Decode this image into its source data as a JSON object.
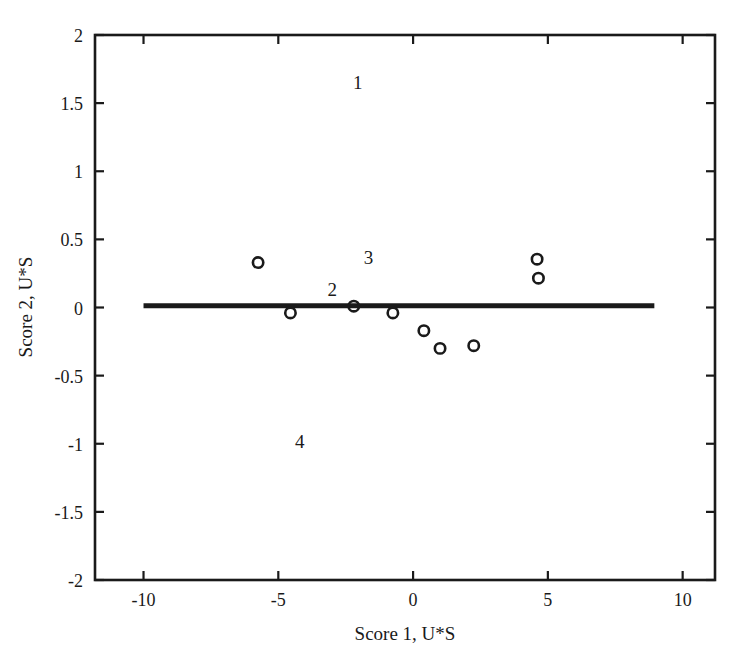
{
  "chart_data": {
    "type": "scatter",
    "title": "",
    "xlabel": "Score 1, U*S",
    "ylabel": "Score 2, U*S",
    "xlim": [
      -11.8,
      11.2
    ],
    "ylim": [
      -2,
      2
    ],
    "xticks": [
      -10,
      -5,
      0,
      5,
      10
    ],
    "xticklabels": [
      "-10",
      "-5",
      "0",
      "5",
      "10"
    ],
    "yticks": [
      -2,
      -1.5,
      -1,
      -0.5,
      0,
      0.5,
      1,
      1.5,
      2
    ],
    "yticklabels": [
      "-2",
      "-1.5",
      "-1",
      "-0.5",
      "0",
      "0.5",
      "1",
      "1.5",
      "2"
    ],
    "grid": false,
    "legend": "none",
    "marker": "open-circle",
    "marker_color": "#1a1a1a",
    "series": [
      {
        "name": "scores",
        "points": [
          {
            "x": -5.75,
            "y": 0.33
          },
          {
            "x": -4.55,
            "y": -0.04
          },
          {
            "x": -2.2,
            "y": 0.01
          },
          {
            "x": -0.75,
            "y": -0.04
          },
          {
            "x": 0.4,
            "y": -0.17
          },
          {
            "x": 1.0,
            "y": -0.3
          },
          {
            "x": 2.25,
            "y": -0.28
          },
          {
            "x": 4.6,
            "y": 0.355
          },
          {
            "x": 4.65,
            "y": 0.215
          }
        ]
      }
    ],
    "reference_line": {
      "name": "horizontal-baseline",
      "y": 0.012,
      "x_start": -10.0,
      "x_end": 8.95,
      "color": "#1a1a1a",
      "width_px": 5
    },
    "annotations": [
      {
        "text": "1",
        "x": -2.05,
        "y": 1.655
      },
      {
        "text": "2",
        "x": -3.0,
        "y": 0.135
      },
      {
        "text": "3",
        "x": -1.65,
        "y": 0.37
      },
      {
        "text": "4",
        "x": -4.2,
        "y": -0.98
      }
    ]
  },
  "axes": {
    "frame_color": "#1a1a1a",
    "background": "#ffffff"
  }
}
